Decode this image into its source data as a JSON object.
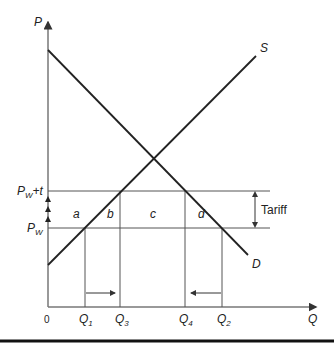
{
  "diagram": {
    "type": "supply-demand-tariff",
    "axes": {
      "y_label": "P",
      "x_label": "Q",
      "origin_label": "0"
    },
    "curves": {
      "supply_label": "S",
      "demand_label": "D"
    },
    "price_levels": {
      "world_price": {
        "main": "P",
        "sub": "W"
      },
      "world_plus_tariff": {
        "main": "P",
        "sub": "W",
        "suffix": "+t"
      }
    },
    "quantities": [
      {
        "main": "Q",
        "sub": "1"
      },
      {
        "main": "Q",
        "sub": "3"
      },
      {
        "main": "Q",
        "sub": "4"
      },
      {
        "main": "Q",
        "sub": "2"
      }
    ],
    "areas": [
      "a",
      "b",
      "c",
      "d"
    ],
    "tariff_label": "Tariff",
    "colors": {
      "line": "#222222",
      "grid": "#555555",
      "axis": "#777777"
    }
  }
}
